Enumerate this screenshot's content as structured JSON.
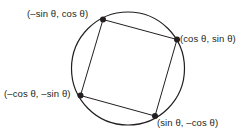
{
  "figure": {
    "background_color": "#ffffff",
    "stroke_color": "#231f20",
    "text_color": "#231f20",
    "width": 247,
    "height": 136
  },
  "circle": {
    "cx": 128,
    "cy": 68.5,
    "r": 56.5,
    "stroke_width": 1.2
  },
  "square": {
    "stroke_width": 1.0,
    "vertices": [
      {
        "id": "top-left",
        "x": 103,
        "y": 19.5,
        "dot_r": 3.0
      },
      {
        "id": "right",
        "x": 177,
        "y": 39.5,
        "dot_r": 3.0
      },
      {
        "id": "bottom-right",
        "x": 155,
        "y": 116,
        "dot_r": 3.0
      },
      {
        "id": "bottom-left",
        "x": 80.5,
        "y": 95.5,
        "dot_r": 3.0
      }
    ],
    "path": "M 103,19.5 L 177,39.5 L 155,116 L 80.5,95.5 Z"
  },
  "labels": {
    "top_left": "(–sin θ, cos θ)",
    "right": "(cos θ, sin θ)",
    "bottom_left": "(–cos θ, –sin θ)",
    "bottom_right": "(sin θ, –cos θ)"
  }
}
